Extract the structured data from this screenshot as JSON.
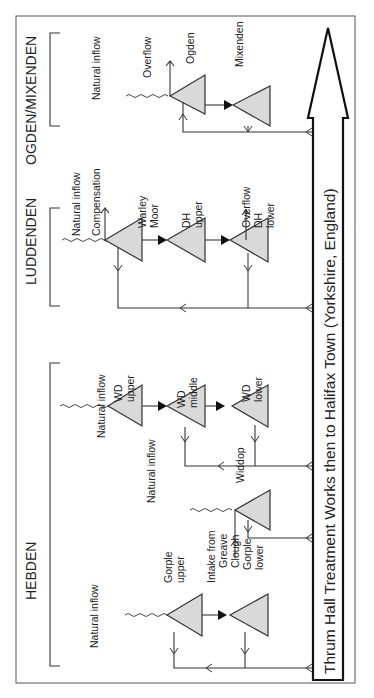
{
  "diagram": {
    "type": "reservoir-flow-schematic",
    "orientation": "rotated-90-ccw",
    "destination_label": "Thrum Hall Treatment Works then to Halifax Town (Yorkshire, England)",
    "colors": {
      "reservoir_fill": "#d9d9d9",
      "line": "#333333",
      "background": "#ffffff"
    },
    "sections": [
      {
        "name": "OGDEN/MIXENDEN",
        "labels": {
          "natural_inflow": "Natural inflow",
          "overflow": "Overflow",
          "ogden": "Ogden",
          "mixenden": "Mixenden"
        }
      },
      {
        "name": "LUDDENDEN",
        "labels": {
          "natural_inflow": "Natural inflow",
          "compensation": "Compensation",
          "warley_1": "Warley",
          "warley_2": "Moor",
          "dh_upper_1": "DH",
          "dh_upper_2": "upper",
          "overflow": "Overflow",
          "dh_lower_1": "DH",
          "dh_lower_2": "lower"
        }
      },
      {
        "name": "HEBDEN",
        "labels": {
          "natural_inflow_wd": "Natural inflow",
          "wd_upper_1": "WD",
          "wd_upper_2": "upper",
          "wd_middle_1": "WD",
          "wd_middle_2": "middle",
          "wd_lower_1": "WD",
          "wd_lower_2": "lower",
          "natural_inflow_widdop": "Natural inflow",
          "widdop": "Widdop",
          "natural_inflow_gorple": "Natural inflow",
          "gorple_upper_1": "Gorple",
          "gorple_upper_2": "upper",
          "intake_1": "Intake from",
          "intake_2": "Greave",
          "intake_3": "Clough",
          "gorple_lower_1": "Gorple",
          "gorple_lower_2": "lower"
        }
      }
    ]
  }
}
